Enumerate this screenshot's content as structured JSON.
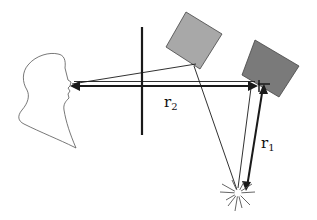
{
  "diagram": {
    "labels": {
      "r2": {
        "main": "r",
        "sub": "2"
      },
      "r1": {
        "main": "r",
        "sub": "1"
      }
    },
    "colors": {
      "light_square": "#a8a8a8",
      "dark_square": "#7a7a7a",
      "lines": "#1a1a1a",
      "profile": "#555555"
    },
    "elements": [
      "head-profile",
      "vertical-barrier",
      "light-gray-square",
      "dark-gray-square",
      "explosion-source",
      "r1-arrow",
      "r2-arrow"
    ]
  }
}
